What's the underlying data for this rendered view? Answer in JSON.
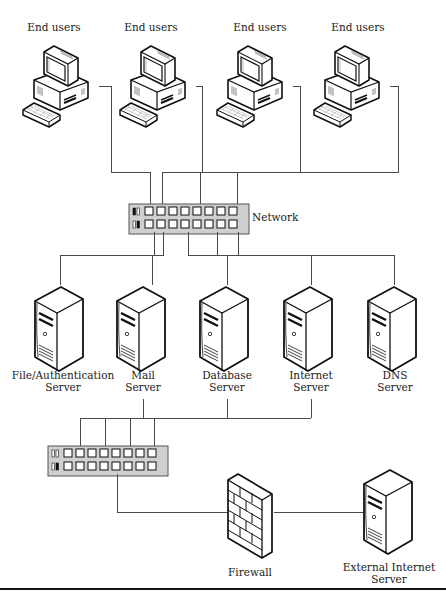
{
  "figure": {
    "colors": {
      "line": "#4a4a4a",
      "icon_stroke": "#111111",
      "switch_fill": "#cfcfcf",
      "background": "#ffffff"
    }
  },
  "end_users": [
    {
      "label": "End users"
    },
    {
      "label": "End users"
    },
    {
      "label": "End users"
    },
    {
      "label": "End users"
    }
  ],
  "network_switch": {
    "label": "Network",
    "ports_per_row": 8,
    "rows": 2
  },
  "servers": [
    {
      "line1": "File/Authentication",
      "line2": "Server"
    },
    {
      "line1": "Mail",
      "line2": "Server"
    },
    {
      "line1": "Database",
      "line2": "Server"
    },
    {
      "line1": "Internet",
      "line2": "Server"
    },
    {
      "line1": "DNS",
      "line2": "Server"
    }
  ],
  "dmz_switch": {
    "label": "",
    "ports_per_row": 8,
    "rows": 2
  },
  "firewall": {
    "label": "Firewall"
  },
  "external_server": {
    "line1": "External Internet",
    "line2": "Server"
  }
}
